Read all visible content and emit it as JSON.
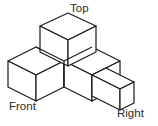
{
  "figure": {
    "background_color": "#ffffff",
    "line_color": "#1a1a1a",
    "face_color": "#ffffff",
    "line_width": 1.2,
    "canvas": {
      "width": 158,
      "height": 126
    }
  },
  "labels": {
    "top": "Top",
    "front": "Front",
    "right": "Right"
  },
  "geometry": {
    "note": "Isometric lattice coordinates in pixels. Each cube is drawn as three visible rhombus faces: top, left, right.",
    "unit": {
      "dx": 28,
      "dy": 14,
      "dz": 26
    },
    "origin": {
      "x": 64,
      "y": 59
    },
    "cubes": [
      {
        "name": "cube-top-back",
        "label": "Top",
        "grid": [
          0,
          0,
          1
        ]
      },
      {
        "name": "cube-front-left",
        "label": "Front",
        "grid": [
          -1,
          0,
          0
        ]
      },
      {
        "name": "cube-back-right",
        "label": "",
        "grid": [
          0,
          1,
          0
        ]
      },
      {
        "name": "cube-right",
        "label": "Right",
        "grid": [
          0,
          2,
          0
        ]
      }
    ]
  }
}
